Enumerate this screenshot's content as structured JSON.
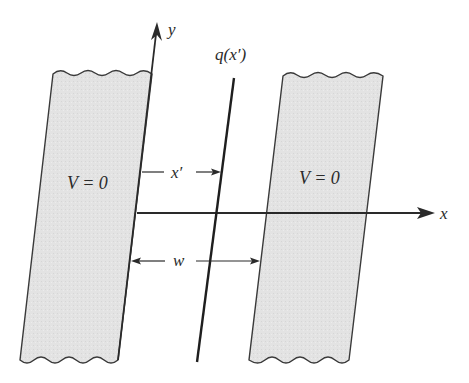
{
  "diagram": {
    "axes": {
      "x_label": "x",
      "y_label": "y"
    },
    "line_charge": {
      "label": "q(x′)"
    },
    "left_slab": {
      "label": "V = 0"
    },
    "right_slab": {
      "label": "V = 0"
    },
    "dimensions": {
      "x_prime_label": "x′",
      "width_label": "w"
    },
    "colors": {
      "slab_fill": "#e3e3e3",
      "line": "#2a2a2a",
      "background": "#ffffff"
    }
  }
}
